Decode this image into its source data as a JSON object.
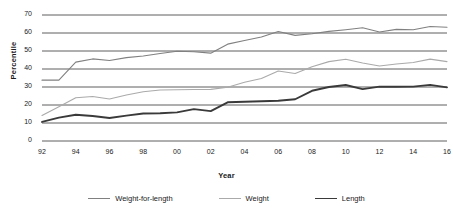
{
  "chart_data": {
    "type": "line",
    "title": "",
    "xlabel": "Year",
    "ylabel": "Percentile",
    "grid": true,
    "legend_position": "bottom",
    "xlim": [
      1992,
      2016
    ],
    "ylim": [
      0,
      70
    ],
    "ytick_values": [
      0,
      10,
      20,
      30,
      40,
      50,
      60,
      70
    ],
    "ytick_labels": [
      "0",
      "10",
      "20",
      "30",
      "40",
      "50",
      "60",
      "70"
    ],
    "xtick_values": [
      1992,
      1994,
      1996,
      1998,
      2000,
      2002,
      2004,
      2006,
      2008,
      2010,
      2012,
      2014,
      2016
    ],
    "xtick_labels": [
      "92",
      "94",
      "96",
      "98",
      "00",
      "02",
      "04",
      "06",
      "08",
      "10",
      "12",
      "14",
      "16"
    ],
    "x": [
      1992,
      1993,
      1994,
      1995,
      1996,
      1997,
      1998,
      1999,
      2000,
      2001,
      2002,
      2003,
      2004,
      2005,
      2006,
      2007,
      2008,
      2009,
      2010,
      2011,
      2012,
      2013,
      2014,
      2015,
      2016
    ],
    "series": [
      {
        "name": "Weight-for-length",
        "color": "#808080",
        "width": 1.1,
        "values": [
          33.8,
          33.8,
          43.8,
          45.6,
          44.7,
          46.3,
          47.2,
          48.6,
          49.9,
          49.6,
          48.8,
          53.8,
          55.8,
          57.8,
          60.8,
          58.7,
          59.6,
          60.9,
          61.8,
          62.9,
          60.6,
          62.0,
          61.8,
          63.6,
          63.2
        ]
      },
      {
        "name": "Weight",
        "color": "#aaaaaa",
        "width": 1.1,
        "values": [
          14.2,
          19.0,
          24.0,
          24.7,
          23.3,
          25.6,
          27.4,
          28.3,
          28.5,
          28.6,
          28.7,
          29.9,
          32.6,
          34.7,
          38.9,
          37.5,
          41.3,
          44.1,
          45.4,
          43.3,
          41.7,
          42.8,
          43.6,
          45.5,
          44.1
        ]
      },
      {
        "name": "Length",
        "color": "#3a3a3a",
        "width": 1.9,
        "values": [
          10.6,
          13.0,
          14.6,
          13.9,
          12.8,
          14.1,
          15.3,
          15.4,
          15.9,
          17.7,
          16.6,
          21.5,
          21.8,
          22.1,
          22.4,
          23.2,
          27.9,
          30.0,
          31.1,
          28.8,
          30.2,
          30.1,
          30.2,
          31.2,
          29.8
        ]
      }
    ]
  },
  "legend": {
    "items": [
      {
        "label": "Weight-for-length",
        "color": "#808080",
        "width": 1.1
      },
      {
        "label": "Weight",
        "color": "#aaaaaa",
        "width": 1.1
      },
      {
        "label": "Length",
        "color": "#3a3a3a",
        "width": 1.9
      }
    ]
  }
}
